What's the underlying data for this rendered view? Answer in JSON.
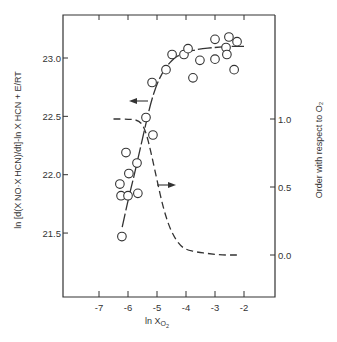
{
  "chart_data": {
    "type": "scatter",
    "title": "",
    "xlabel": "ln X_O2",
    "ylabel": "ln [d(X_NO·X_HCN)/dt]-ln X_HCN + E/RT",
    "y2label": "Order with respect to O2",
    "xlim": [
      -8.2,
      -0.7
    ],
    "ylim": [
      20.9,
      23.37
    ],
    "y2lim": [
      -0.31,
      1.54
    ],
    "x_ticks": [
      -7,
      -6,
      -5,
      -4,
      -3,
      -2
    ],
    "x_tick_labels": [
      "-7",
      "-6",
      "-5",
      "-4",
      "-3",
      "-2"
    ],
    "y_ticks": [
      21.5,
      22.0,
      22.5,
      23.0
    ],
    "y_tick_labels": [
      "21.5",
      "22.0",
      "22.5",
      "23.0"
    ],
    "y2_ticks": [
      0.0,
      0.5,
      1.0
    ],
    "y2_tick_labels": [
      "0.0",
      "0.5",
      "1.0"
    ],
    "grid": false,
    "series": [
      {
        "name": "Measured rate (left axis)",
        "type": "scatter",
        "marker": "open-circle",
        "axis": "left",
        "x": [
          -6.21,
          -6.28,
          -6.24,
          -6.0,
          -6.07,
          -5.97,
          -5.66,
          -5.69,
          -5.38,
          -5.14,
          -5.17,
          -4.69,
          -4.48,
          -4.07,
          -3.93,
          -3.52,
          -3.76,
          -3.0,
          -3.0,
          -2.52,
          -2.24,
          -2.62,
          -2.59,
          -2.34
        ],
        "y": [
          21.47,
          21.92,
          21.82,
          21.82,
          22.19,
          22.01,
          21.84,
          22.1,
          22.49,
          22.34,
          22.79,
          22.9,
          23.03,
          23.03,
          23.08,
          22.98,
          22.83,
          22.99,
          23.16,
          23.18,
          23.14,
          23.09,
          23.03,
          22.9
        ]
      },
      {
        "name": "Fitted rate curve (left axis)",
        "type": "line",
        "style": "solid-dash",
        "axis": "left",
        "x": [
          -6.2,
          -6.0,
          -5.8,
          -5.6,
          -5.4,
          -5.2,
          -5.0,
          -4.8,
          -4.6,
          -4.4,
          -4.2,
          -4.0,
          -3.5,
          -3.0,
          -2.5,
          -2.0
        ],
        "y": [
          21.55,
          21.78,
          21.98,
          22.2,
          22.42,
          22.63,
          22.78,
          22.88,
          22.95,
          23.0,
          23.03,
          23.05,
          23.08,
          23.09,
          23.1,
          23.1
        ]
      },
      {
        "name": "Order with respect to O2 (right axis)",
        "type": "line",
        "style": "dashed",
        "axis": "right",
        "x": [
          -6.5,
          -6.0,
          -5.6,
          -5.4,
          -5.2,
          -5.0,
          -4.8,
          -4.6,
          -4.4,
          -4.2,
          -4.0,
          -3.6,
          -3.2,
          -2.8,
          -2.4,
          -2.2
        ],
        "y": [
          1.0,
          1.0,
          0.99,
          0.92,
          0.75,
          0.55,
          0.36,
          0.22,
          0.13,
          0.07,
          0.04,
          0.02,
          0.01,
          0.0,
          0.0,
          0.0
        ]
      }
    ],
    "annotations": [
      {
        "type": "arrow",
        "direction": "left",
        "x": -5.5,
        "y": 22.67,
        "meaning": "circles/solid curve refer to left axis"
      },
      {
        "type": "arrow",
        "direction": "right",
        "x": -4.9,
        "y_right": 0.5,
        "meaning": "dashed curve refers to right axis"
      }
    ]
  },
  "labels": {
    "x_axis": "ln X",
    "x_axis_sub": "O",
    "x_axis_subsub": "2",
    "y_axis": "ln [d(X NO·X HCN)/dt]-ln X HCN + E/RT",
    "y2_axis": "Order with respect to O₂"
  }
}
